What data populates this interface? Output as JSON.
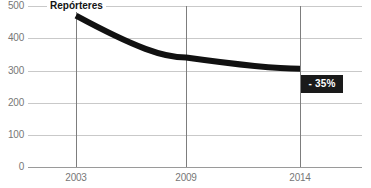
{
  "chart_data": {
    "type": "line",
    "title": "Repórteres",
    "xlabel": "",
    "ylabel": "",
    "categories": [
      "2003",
      "2009",
      "2014"
    ],
    "x": [
      2003,
      2009,
      2014
    ],
    "values": [
      470,
      340,
      305
    ],
    "series": [
      {
        "name": "Repórteres",
        "values": [
          470,
          340,
          305
        ],
        "color": "#111111"
      }
    ],
    "ylim": [
      0,
      500
    ],
    "yticks": [
      0,
      100,
      200,
      300,
      400,
      500
    ],
    "ytick_labels": [
      "0",
      "100",
      "200",
      "300",
      "400",
      "500"
    ],
    "grid": true,
    "legend": "none",
    "annotations": [
      {
        "name": "change-badge",
        "text": "- 35%",
        "background": "#1a1a1a",
        "color": "#ffffff"
      }
    ]
  },
  "style": {
    "grid_color": "#c9c9c9",
    "axis_color": "#9a9a9a",
    "tick_color": "#7d7d7d",
    "label_color": "#777777",
    "series_color": "#111111",
    "badge_color": "#1a1a1a",
    "background": "#ffffff"
  }
}
